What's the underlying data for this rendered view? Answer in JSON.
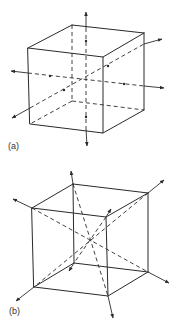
{
  "figure": {
    "colors": {
      "line": "#2a2a2a",
      "background": "#ffffff",
      "label": "#333333"
    },
    "panels": [
      {
        "id": "a",
        "label": "(a)",
        "description": "Cube with three four-fold rotation axes through face centers",
        "axis_type": "face-center axes",
        "label_pos": [
          8,
          150
        ]
      },
      {
        "id": "b",
        "label": "(b)",
        "description": "Cube with four three-fold rotation axes along body diagonals",
        "axis_type": "body-diagonal axes",
        "label_pos": [
          9,
          315
        ]
      }
    ]
  }
}
